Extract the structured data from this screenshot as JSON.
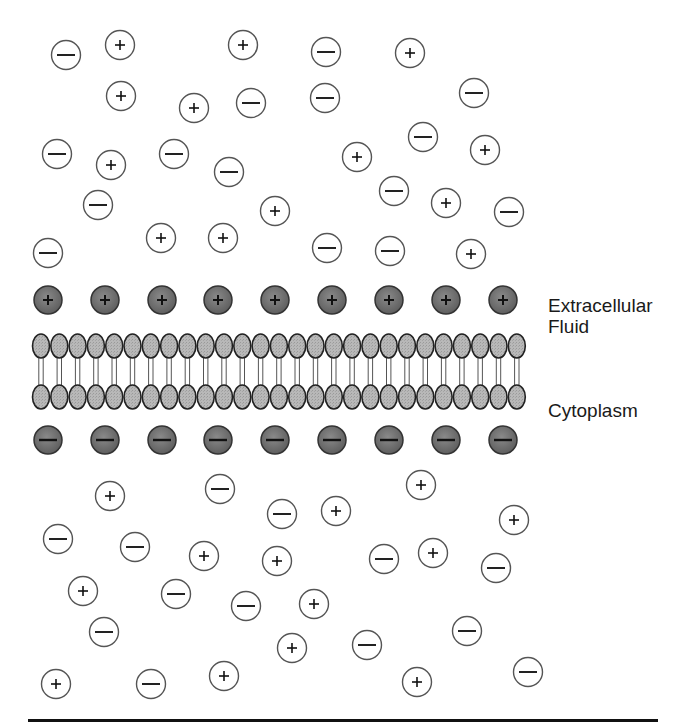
{
  "labels": {
    "extracellular_line1": "Extracellular",
    "extracellular_line2": "Fluid",
    "cytoplasm": "Cytoplasm"
  },
  "colors": {
    "free_ion_stroke": "#555555",
    "bound_ion_fill": "#6f6f6f",
    "bound_ion_stroke": "#333333",
    "phospholipid_head_fill": "#b4b4b4",
    "phospholipid_head_stroke": "#222222",
    "tail_stroke": "#555555",
    "text": "#1a1a1a"
  },
  "membrane": {
    "phospholipid_count": 27,
    "first_x": 41,
    "spacing": 18.3,
    "top_head_y": 346,
    "bottom_head_y": 397,
    "head_rx": 8.5,
    "head_ry": 12
  },
  "bound_ions": {
    "x_positions": [
      48,
      105,
      162,
      218,
      275,
      332,
      389,
      446,
      503
    ],
    "positive_row_y": 300,
    "negative_row_y": 440,
    "radius": 14
  },
  "extracellular_ions": [
    {
      "x": 66,
      "y": 55,
      "charge": "-"
    },
    {
      "x": 120,
      "y": 45,
      "charge": "+"
    },
    {
      "x": 243,
      "y": 45,
      "charge": "+"
    },
    {
      "x": 326,
      "y": 52,
      "charge": "-"
    },
    {
      "x": 410,
      "y": 53,
      "charge": "+"
    },
    {
      "x": 121,
      "y": 96,
      "charge": "+"
    },
    {
      "x": 194,
      "y": 108,
      "charge": "+"
    },
    {
      "x": 251,
      "y": 103,
      "charge": "-"
    },
    {
      "x": 325,
      "y": 98,
      "charge": "-"
    },
    {
      "x": 474,
      "y": 93,
      "charge": "-"
    },
    {
      "x": 57,
      "y": 154,
      "charge": "-"
    },
    {
      "x": 111,
      "y": 165,
      "charge": "+"
    },
    {
      "x": 174,
      "y": 154,
      "charge": "-"
    },
    {
      "x": 229,
      "y": 172,
      "charge": "-"
    },
    {
      "x": 357,
      "y": 157,
      "charge": "+"
    },
    {
      "x": 423,
      "y": 137,
      "charge": "-"
    },
    {
      "x": 485,
      "y": 150,
      "charge": "+"
    },
    {
      "x": 98,
      "y": 205,
      "charge": "-"
    },
    {
      "x": 275,
      "y": 211,
      "charge": "+"
    },
    {
      "x": 394,
      "y": 191,
      "charge": "-"
    },
    {
      "x": 446,
      "y": 203,
      "charge": "+"
    },
    {
      "x": 509,
      "y": 212,
      "charge": "-"
    },
    {
      "x": 48,
      "y": 253,
      "charge": "-"
    },
    {
      "x": 161,
      "y": 238,
      "charge": "+"
    },
    {
      "x": 223,
      "y": 238,
      "charge": "+"
    },
    {
      "x": 327,
      "y": 248,
      "charge": "-"
    },
    {
      "x": 390,
      "y": 251,
      "charge": "-"
    },
    {
      "x": 471,
      "y": 254,
      "charge": "+"
    }
  ],
  "cytoplasm_ions": [
    {
      "x": 110,
      "y": 496,
      "charge": "+"
    },
    {
      "x": 220,
      "y": 489,
      "charge": "-"
    },
    {
      "x": 282,
      "y": 514,
      "charge": "-"
    },
    {
      "x": 336,
      "y": 511,
      "charge": "+"
    },
    {
      "x": 421,
      "y": 485,
      "charge": "+"
    },
    {
      "x": 514,
      "y": 520,
      "charge": "+"
    },
    {
      "x": 58,
      "y": 539,
      "charge": "-"
    },
    {
      "x": 135,
      "y": 547,
      "charge": "-"
    },
    {
      "x": 204,
      "y": 556,
      "charge": "+"
    },
    {
      "x": 277,
      "y": 561,
      "charge": "+"
    },
    {
      "x": 384,
      "y": 559,
      "charge": "-"
    },
    {
      "x": 433,
      "y": 553,
      "charge": "+"
    },
    {
      "x": 496,
      "y": 568,
      "charge": "-"
    },
    {
      "x": 83,
      "y": 591,
      "charge": "+"
    },
    {
      "x": 176,
      "y": 594,
      "charge": "-"
    },
    {
      "x": 246,
      "y": 606,
      "charge": "-"
    },
    {
      "x": 314,
      "y": 604,
      "charge": "+"
    },
    {
      "x": 104,
      "y": 632,
      "charge": "-"
    },
    {
      "x": 467,
      "y": 631,
      "charge": "-"
    },
    {
      "x": 292,
      "y": 648,
      "charge": "+"
    },
    {
      "x": 367,
      "y": 645,
      "charge": "-"
    },
    {
      "x": 56,
      "y": 684,
      "charge": "+"
    },
    {
      "x": 151,
      "y": 684,
      "charge": "-"
    },
    {
      "x": 224,
      "y": 676,
      "charge": "+"
    },
    {
      "x": 417,
      "y": 682,
      "charge": "+"
    },
    {
      "x": 528,
      "y": 672,
      "charge": "-"
    }
  ],
  "free_ion_radius": 14.5
}
